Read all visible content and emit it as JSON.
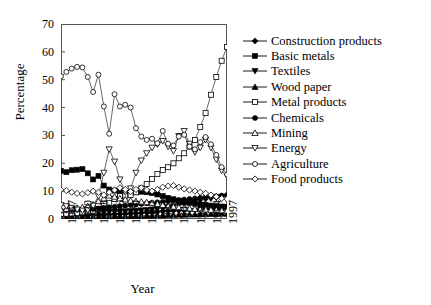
{
  "chart_data": {
    "type": "line",
    "title": "",
    "xlabel": "Year",
    "ylabel": "Percentage",
    "xlim": [
      1967,
      1998
    ],
    "ylim": [
      0,
      70
    ],
    "yticks": [
      0,
      10,
      20,
      30,
      40,
      50,
      60,
      70
    ],
    "xticks": [
      "1967",
      "1970",
      "1973",
      "1976",
      "1979",
      "1982",
      "1985",
      "1988",
      "1991",
      "1994",
      "1997"
    ],
    "grid": false,
    "legend_position": "right",
    "x": [
      1967,
      1968,
      1969,
      1970,
      1971,
      1972,
      1973,
      1974,
      1975,
      1976,
      1977,
      1978,
      1979,
      1980,
      1981,
      1982,
      1983,
      1984,
      1985,
      1986,
      1987,
      1988,
      1989,
      1990,
      1991,
      1992,
      1993,
      1994,
      1995,
      1996,
      1997,
      1998
    ],
    "series": [
      {
        "name": "Construction products",
        "marker": "filled-diamond",
        "values": [
          1.2,
          1.2,
          1.3,
          1.3,
          1.3,
          1.4,
          1.4,
          1.5,
          1.5,
          1.6,
          1.7,
          1.8,
          1.9,
          2.0,
          2.1,
          2.2,
          2.4,
          2.5,
          2.6,
          2.8,
          2.9,
          3.0,
          3.1,
          3.2,
          3.3,
          3.4,
          3.4,
          3.5,
          3.6,
          3.6,
          3.7,
          3.7
        ]
      },
      {
        "name": "Basic metals",
        "marker": "filled-square",
        "values": [
          17.3,
          16.8,
          17.5,
          17.7,
          17.9,
          16.4,
          14.2,
          15.5,
          12.0,
          10.6,
          10.2,
          9.7,
          9.3,
          9.4,
          9.6,
          9.8,
          9.6,
          9.3,
          8.8,
          8.2,
          7.6,
          7.1,
          6.6,
          6.2,
          5.8,
          5.5,
          5.2,
          5.0,
          4.8,
          4.6,
          4.5,
          4.4
        ]
      },
      {
        "name": "Textiles",
        "marker": "filled-triangle-down",
        "values": [
          2.1,
          2.1,
          2.2,
          2.2,
          2.3,
          2.3,
          2.4,
          2.4,
          2.5,
          2.6,
          2.6,
          2.7,
          2.8,
          2.9,
          3.0,
          3.1,
          3.2,
          3.4,
          3.6,
          3.9,
          4.2,
          4.6,
          5.0,
          5.4,
          5.8,
          6.2,
          6.6,
          7.0,
          7.3,
          7.6,
          7.8,
          8.0
        ]
      },
      {
        "name": "Wood paper",
        "marker": "filled-triangle-up",
        "values": [
          0.5,
          0.5,
          0.6,
          0.6,
          0.6,
          0.7,
          0.7,
          0.7,
          0.8,
          0.8,
          0.9,
          0.9,
          1.0,
          1.0,
          1.1,
          1.1,
          1.2,
          1.2,
          1.3,
          1.3,
          1.4,
          1.4,
          1.5,
          1.5,
          1.6,
          1.6,
          1.7,
          1.7,
          1.8,
          1.8,
          1.9,
          1.9
        ]
      },
      {
        "name": "Metal products",
        "marker": "open-square",
        "values": [
          1.8,
          1.9,
          2.0,
          2.2,
          2.4,
          2.6,
          3.0,
          3.6,
          4.6,
          5.8,
          7.2,
          8.2,
          8.4,
          8.6,
          9.6,
          11.0,
          12.6,
          14.4,
          16.2,
          17.6,
          18.6,
          20.0,
          21.8,
          23.6,
          26.0,
          28.4,
          33.0,
          38.0,
          44.6,
          51.0,
          56.8,
          61.8
        ]
      },
      {
        "name": "Chemicals",
        "marker": "filled-circle",
        "values": [
          3.0,
          3.1,
          3.2,
          3.3,
          3.4,
          3.5,
          3.6,
          3.8,
          4.0,
          4.2,
          4.4,
          4.6,
          4.8,
          5.0,
          5.2,
          5.4,
          5.6,
          5.8,
          6.0,
          6.2,
          6.4,
          6.6,
          6.8,
          7.0,
          7.2,
          7.4,
          7.6,
          7.8,
          8.0,
          8.2,
          8.4,
          8.6
        ]
      },
      {
        "name": "Mining",
        "marker": "open-triangle-up",
        "values": [
          3.3,
          3.6,
          3.8,
          4.0,
          4.2,
          4.6,
          5.2,
          6.4,
          7.4,
          8.4,
          8.0,
          7.4,
          7.0,
          6.6,
          6.4,
          6.2,
          6.0,
          5.8,
          5.4,
          5.0,
          4.6,
          4.4,
          4.2,
          4.0,
          3.8,
          3.6,
          3.5,
          3.4,
          3.3,
          3.2,
          3.1,
          3.0
        ]
      },
      {
        "name": "Energy",
        "marker": "open-triangle-down",
        "values": [
          5.0,
          4.6,
          4.0,
          3.4,
          3.0,
          3.2,
          4.8,
          8.2,
          16.6,
          25.0,
          20.6,
          14.2,
          9.6,
          11.0,
          16.6,
          21.0,
          23.6,
          25.6,
          26.8,
          28.0,
          26.0,
          24.4,
          29.8,
          31.6,
          27.0,
          24.0,
          25.6,
          28.4,
          25.6,
          21.4,
          17.4,
          15.4
        ]
      },
      {
        "name": "Agriculture",
        "marker": "open-circle",
        "values": [
          51.2,
          52.8,
          54.0,
          54.6,
          54.4,
          51.0,
          45.6,
          51.8,
          40.4,
          30.6,
          44.8,
          40.4,
          41.0,
          40.0,
          32.6,
          29.6,
          28.4,
          28.8,
          27.2,
          31.6,
          27.0,
          26.4,
          29.6,
          30.2,
          26.0,
          25.0,
          27.6,
          29.4,
          26.8,
          23.0,
          18.6,
          16.0
        ]
      },
      {
        "name": "Food products",
        "marker": "open-diamond",
        "values": [
          10.4,
          10.2,
          9.6,
          9.2,
          9.0,
          9.4,
          10.0,
          9.6,
          8.6,
          9.6,
          10.4,
          11.2,
          10.6,
          9.8,
          10.6,
          11.2,
          10.4,
          10.0,
          10.6,
          11.4,
          11.8,
          12.0,
          11.4,
          10.8,
          10.4,
          10.0,
          9.6,
          9.2,
          8.6,
          8.0,
          7.4,
          7.2
        ]
      }
    ]
  }
}
